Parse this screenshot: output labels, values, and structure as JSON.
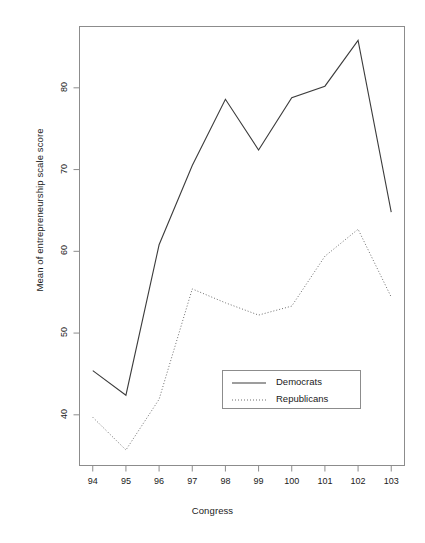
{
  "chart_data": {
    "type": "line",
    "title": "",
    "xlabel": "Congress",
    "ylabel": "Mean of entrepreneurship scale score",
    "categories": [
      "94",
      "95",
      "96",
      "97",
      "98",
      "99",
      "100",
      "101",
      "102",
      "103"
    ],
    "x": [
      94,
      95,
      96,
      97,
      98,
      99,
      100,
      101,
      102,
      103
    ],
    "xlim": [
      93.6,
      103.4
    ],
    "ylim": [
      33.8,
      87.5
    ],
    "xticks": [
      94,
      95,
      96,
      97,
      98,
      99,
      100,
      101,
      102,
      103
    ],
    "yticks": [
      40,
      50,
      60,
      70,
      80
    ],
    "ytick_labels": [
      "40",
      "50",
      "60",
      "70",
      "80"
    ],
    "xtick_labels": [
      "94",
      "95",
      "96",
      "97",
      "98",
      "99",
      "100",
      "101",
      "102",
      "103"
    ],
    "grid": false,
    "legend_position": "center-right-lower",
    "series": [
      {
        "name": "Democrats",
        "style": "solid",
        "color": "#3c3c3c",
        "values": [
          45.4,
          42.4,
          60.8,
          70.5,
          78.6,
          72.4,
          78.8,
          80.2,
          85.8,
          64.8
        ]
      },
      {
        "name": "Republicans",
        "style": "dotted",
        "color": "#6e6e6e",
        "values": [
          39.7,
          35.7,
          41.9,
          55.4,
          53.7,
          52.2,
          53.3,
          59.4,
          62.7,
          54.4
        ]
      }
    ]
  },
  "legend": {
    "entries": [
      {
        "label": "Democrats",
        "style": "solid"
      },
      {
        "label": "Republicans",
        "style": "dotted"
      }
    ]
  },
  "axes": {
    "x_title": "Congress",
    "y_title": "Mean of entrepreneurship scale score"
  },
  "colors": {
    "frame": "#8c8c8c",
    "democrats": "#3c3c3c",
    "republicans": "#6e6e6e",
    "text": "#1a1a1a"
  }
}
